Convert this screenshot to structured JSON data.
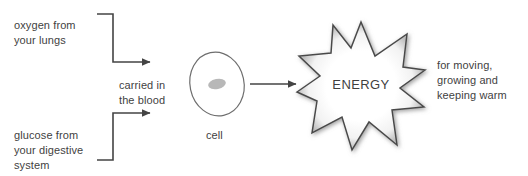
{
  "diagram": {
    "line_color": "#444444",
    "text_color": "#3f3f3f",
    "cell_outline_color": "#6e6e6e",
    "nucleus_color": "#b8b8b8",
    "star_outline_color": "#4a4a4a",
    "star_fill_color": "#ffffff",
    "star_shadow_color": "#9a9a9a",
    "background_color": "#ffffff",
    "inputs": [
      {
        "id": "oxygen",
        "text": "oxygen from\nyour lungs"
      },
      {
        "id": "glucose",
        "text": "glucose from\nyour digestive\nsystem"
      }
    ],
    "transport_label": "carried in\nthe blood",
    "cell_label": "cell",
    "energy_label": "ENERGY",
    "outputs_label": "for moving,\ngrowing and\nkeeping warm"
  }
}
